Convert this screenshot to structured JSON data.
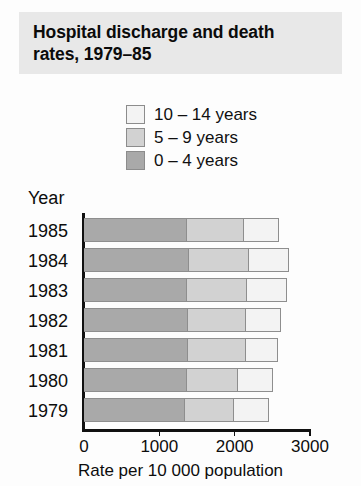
{
  "title": "Hospital discharge and death\nrates, 1979–85",
  "legend": {
    "position": "top",
    "items": [
      {
        "label": "10 – 14 years",
        "color": "#f3f3f3"
      },
      {
        "label": "5 – 9 years",
        "color": "#d2d2d2"
      },
      {
        "label": "0 – 4 years",
        "color": "#a9a9a9"
      }
    ]
  },
  "axes": {
    "y_title": "Year",
    "x_title": "Rate per 10 000 population",
    "x_ticks": [
      "0",
      "1000",
      "2000",
      "3000"
    ]
  },
  "chart_data": {
    "type": "bar",
    "orientation": "horizontal",
    "stacked": true,
    "title": "Hospital discharge and death rates, 1979–85",
    "xlabel": "Rate per 10 000 population",
    "ylabel": "Year",
    "xlim": [
      0,
      3000
    ],
    "xticks": [
      0,
      1000,
      2000,
      3000
    ],
    "grid": false,
    "legend_position": "top",
    "categories": [
      "1985",
      "1984",
      "1983",
      "1982",
      "1981",
      "1980",
      "1979"
    ],
    "series": [
      {
        "name": "0 – 4 years",
        "color": "#a9a9a9",
        "values": [
          1370,
          1390,
          1365,
          1380,
          1380,
          1365,
          1340
        ]
      },
      {
        "name": "5 – 9 years",
        "color": "#d2d2d2",
        "values": [
          750,
          795,
          805,
          765,
          765,
          685,
          645
        ]
      },
      {
        "name": "10 – 14 years",
        "color": "#f3f3f3",
        "values": [
          465,
          530,
          520,
          465,
          425,
          465,
          465
        ]
      }
    ],
    "totals": [
      2585,
      2715,
      2690,
      2610,
      2570,
      2515,
      2450
    ]
  }
}
